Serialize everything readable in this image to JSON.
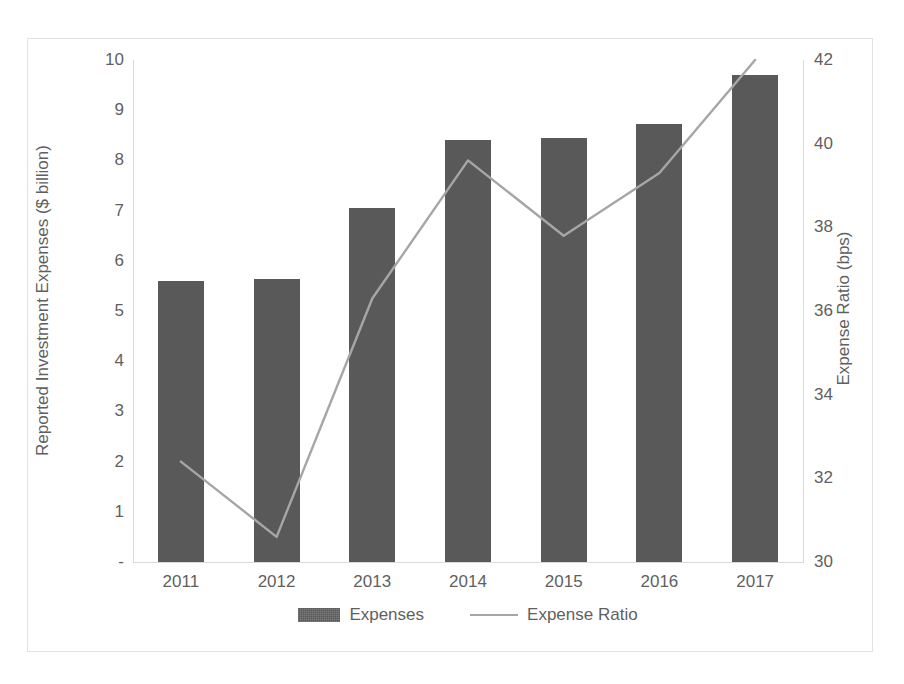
{
  "chart_data": {
    "type": "bar",
    "title": "",
    "subtitle": "",
    "xlabel": "",
    "categories": [
      "2011",
      "2012",
      "2013",
      "2014",
      "2015",
      "2016",
      "2017"
    ],
    "grid": false,
    "legend_position": "bottom",
    "series": [
      {
        "name": "Expenses",
        "type": "bar",
        "axis": "left",
        "unit": "$ billion",
        "color": "#595959",
        "values": [
          5.6,
          5.64,
          7.05,
          8.4,
          8.45,
          8.72,
          9.7
        ]
      },
      {
        "name": "Expense Ratio",
        "type": "line",
        "axis": "right",
        "unit": "bps",
        "color": "#a6a6a6",
        "values": [
          32.4,
          30.6,
          36.3,
          39.6,
          37.8,
          39.3,
          42.0
        ]
      }
    ],
    "left_axis": {
      "label": "Reported Investment Expenses ($ billion)",
      "ticks": [
        "10",
        "9",
        "8",
        "7",
        "6",
        "5",
        "4",
        "3",
        "2",
        "1",
        "-"
      ],
      "tick_values": [
        10,
        9,
        8,
        7,
        6,
        5,
        4,
        3,
        2,
        1,
        0
      ],
      "ylim": [
        0,
        10
      ]
    },
    "right_axis": {
      "label": "Expense Ratio (bps)",
      "ticks": [
        "42",
        "40",
        "38",
        "36",
        "34",
        "32",
        "30"
      ],
      "tick_values": [
        42,
        40,
        38,
        36,
        34,
        32,
        30
      ],
      "ylim": [
        30,
        42
      ]
    }
  },
  "legend": {
    "items": [
      {
        "label": "Expenses",
        "marker": "bar-swatch"
      },
      {
        "label": "Expense Ratio",
        "marker": "line-swatch"
      }
    ]
  },
  "colors": {
    "bar": "#595959",
    "line": "#a6a6a6",
    "axis": "#d9d9d9",
    "text": "#5f5f5f",
    "frame": "#e2e2e2",
    "background": "#ffffff"
  }
}
